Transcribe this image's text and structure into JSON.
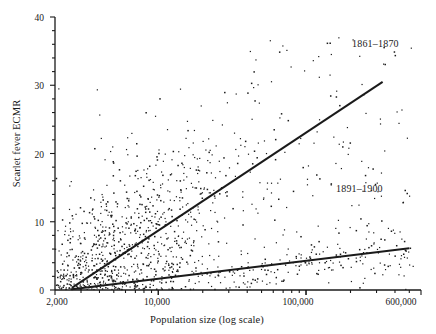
{
  "chart_data": {
    "type": "scatter",
    "title": "",
    "xlabel": "Population size (log scale)",
    "ylabel": "Scarlet fever ECMR",
    "x_scale": "log",
    "xlim": [
      2000,
      600000
    ],
    "ylim": [
      0,
      40
    ],
    "grid": false,
    "legend_position": "inline-annotation",
    "x_tick_labels": [
      "2,000",
      "10,000",
      "100,000",
      "600,000"
    ],
    "x_tick_values": [
      2000,
      10000,
      100000,
      600000
    ],
    "y_tick_labels": [
      "0",
      "10",
      "20",
      "30",
      "40"
    ],
    "y_tick_values": [
      0,
      10,
      20,
      30,
      40
    ],
    "y_minor_tick_step": 2,
    "annotations": [
      {
        "label": "1861–1870",
        "x": 250000,
        "y": 33.5
      },
      {
        "label": "1891–1900",
        "x": 230000,
        "y": 16.5
      }
    ],
    "series": [
      {
        "name": "1861–1870",
        "type": "trend-line",
        "color": "#1a1a1a",
        "line_start": {
          "x": 2600,
          "y": 0.3
        },
        "line_end": {
          "x": 330000,
          "y": 30.5
        }
      },
      {
        "name": "1891–1900",
        "type": "trend-line",
        "color": "#1a1a1a",
        "line_start": {
          "x": 2600,
          "y": 0.1
        },
        "line_end": {
          "x": 500000,
          "y": 6.1
        }
      }
    ],
    "points_description": "Dense cloud of small black markers, heaviest between 8,000 and 40,000 population with ECMR 2–25; scattered high values up to 39 near 200,000–400,000 population.",
    "point_color": "#1a1a1a",
    "point_count": 1100
  },
  "axes": {
    "y_label": "Scarlet fever ECMR",
    "x_label": "Population size (log scale)"
  }
}
